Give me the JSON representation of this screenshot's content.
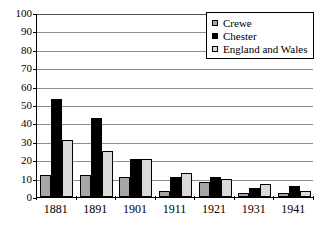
{
  "chart_data": {
    "type": "bar",
    "title": "",
    "subtitle": "",
    "xlabel": "",
    "ylabel": "",
    "categories": [
      "1881",
      "1891",
      "1901",
      "1911",
      "1921",
      "1931",
      "1941"
    ],
    "series": [
      {
        "name": "Crewe",
        "color": "#a6a6a6",
        "values": [
          12,
          12,
          11,
          3,
          8,
          2,
          2
        ]
      },
      {
        "name": "Chester",
        "color": "#000000",
        "values": [
          53,
          43,
          20.5,
          11,
          11,
          5,
          6
        ]
      },
      {
        "name": "England and Wales",
        "color": "#d9d9d9",
        "values": [
          31,
          25,
          20.5,
          13,
          10,
          7,
          3
        ]
      }
    ],
    "ylim": [
      0,
      100
    ],
    "ytick_step": 10,
    "yticks": [
      "0",
      "10",
      "20",
      "30",
      "40",
      "50",
      "60",
      "70",
      "80",
      "90",
      "100"
    ],
    "grid": true,
    "grid_axis": "y",
    "legend_position": "top-right",
    "legend_entries": [
      "Crewe",
      "Chester",
      "England and Wales"
    ]
  },
  "legend": {
    "items": [
      {
        "label": "Crewe",
        "swatch": "crewe-swatch"
      },
      {
        "label": "Chester",
        "swatch": "chester-swatch"
      },
      {
        "label": "England and Wales",
        "swatch": "england-and-wales-swatch"
      }
    ]
  }
}
